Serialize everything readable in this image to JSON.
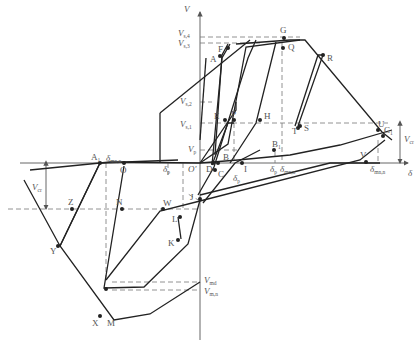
{
  "figure": {
    "type": "hysteresis-model-diagram",
    "axes": {
      "x_label": "δ",
      "y_label": "V",
      "origin_label": "O"
    },
    "force_levels": {
      "V_s4": {
        "label": "V",
        "sub": "s,4"
      },
      "V_s3": {
        "label": "V",
        "sub": "s,3"
      },
      "V_s2": {
        "label": "V",
        "sub": "s,2"
      },
      "V_s1": {
        "label": "V",
        "sub": "s,1"
      },
      "V_p": {
        "label": "V",
        "sub": "p"
      },
      "V_md": {
        "label": "V",
        "sub": "md"
      },
      "V_mn": {
        "label": "V",
        "sub": "m,n"
      },
      "V_cr_right": {
        "label": "V",
        "sub": "cr"
      },
      "V_cr_left": {
        "label": "V",
        "sub": "cr"
      }
    },
    "displacement_labels": {
      "delta_mn_left": {
        "label": "δ",
        "sub": "mn,n"
      },
      "delta_p_left": {
        "label": "δ",
        "sub": "p"
      },
      "delta_p_center": {
        "label": "δ",
        "sub": "p"
      },
      "delta_p_right": {
        "label": "δ",
        "sub": "p"
      },
      "delta_mn_right": {
        "label": "δ",
        "sub": "mn,n"
      },
      "delta_mn_far": {
        "label": "δ",
        "sub": "mn,n"
      }
    },
    "points": {
      "A": "A",
      "F": "F",
      "G": "G",
      "Q": "Q",
      "R": "R",
      "E": "E",
      "P": "P",
      "H": "H",
      "S": "S",
      "T": "T",
      "U": "U",
      "C1": "C",
      "C1_sub": "1",
      "V": "V",
      "B": "B",
      "B1": "B",
      "B1_sub": "1",
      "D": "D",
      "C": "C",
      "I": "I",
      "J": "J",
      "L": "L",
      "K": "K",
      "W": "W",
      "O2": "O",
      "A1": "A",
      "A1_sub": "1",
      "N": "N",
      "Z": "Z",
      "Y": "Y",
      "X": "X",
      "M": "M",
      "O_prime": "O'"
    }
  }
}
